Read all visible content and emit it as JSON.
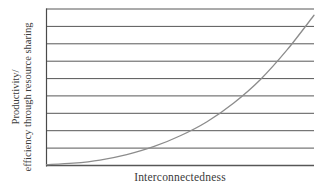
{
  "chart_data": {
    "type": "line",
    "title": "",
    "subtitle": "",
    "xlabel": "Interconnectedness",
    "ylabel_line1": "Productivity/",
    "ylabel_line2": "efficiency through resource sharing",
    "ylabel": "Productivity/ efficiency through resource sharing",
    "grid": true,
    "grid_orientation": "horizontal",
    "gridline_count": 10,
    "legend": "none",
    "legend_position": "none",
    "xlim": [
      0,
      100
    ],
    "ylim": [
      0,
      100
    ],
    "x_tick_labels": [],
    "y_tick_labels": [],
    "annotations": [],
    "series": [
      {
        "name": "Productivity vs interconnectedness",
        "shape": "exponential-increasing",
        "color": "#8c8c8c",
        "x": [
          0,
          10,
          20,
          30,
          40,
          50,
          60,
          70,
          80,
          90,
          100
        ],
        "y": [
          0.5,
          1.5,
          3.5,
          7,
          12,
          19,
          28,
          40,
          55,
          74,
          96
        ]
      }
    ],
    "colors": {
      "curve": "#8c8c8c",
      "gridline": "#575757",
      "axis": "#4a4a4a",
      "text": "#3a3a3a",
      "background": "#ffffff"
    }
  }
}
